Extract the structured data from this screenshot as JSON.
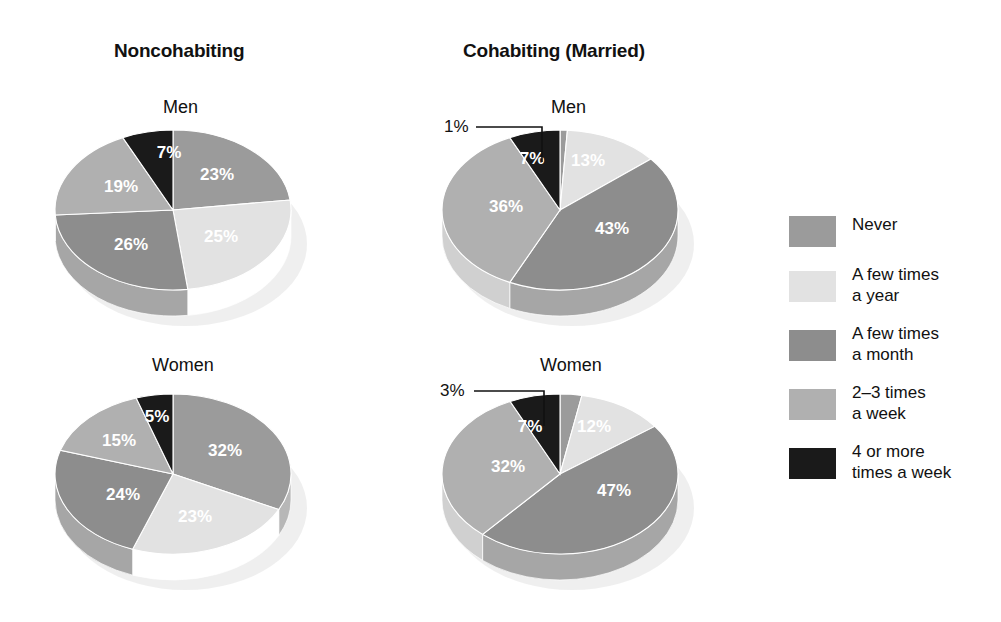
{
  "figure": {
    "columns": [
      {
        "title": "Noncohabiting"
      },
      {
        "title": "Cohabiting (Married)"
      }
    ]
  },
  "legend": {
    "items": [
      {
        "label": "Never",
        "color": "#9b9b9b"
      },
      {
        "label": "A few times\na year",
        "color": "#e2e2e2"
      },
      {
        "label": "A few times\na month",
        "color": "#8d8d8d"
      },
      {
        "label": "2–3 times\na week",
        "color": "#b0b0b0"
      },
      {
        "label": "4 or more\ntimes a week",
        "color": "#1a1a1a"
      }
    ]
  },
  "panels": [
    {
      "id": "noncohabiting-men",
      "group": "Noncohabiting",
      "title": "Men"
    },
    {
      "id": "cohabiting-men",
      "group": "Cohabiting (Married)",
      "title": "Men"
    },
    {
      "id": "noncohabiting-women",
      "group": "Noncohabiting",
      "title": "Women"
    },
    {
      "id": "cohabiting-women",
      "group": "Cohabiting (Married)",
      "title": "Women"
    }
  ],
  "chart_data": [
    {
      "type": "pie",
      "id": "noncohabiting-men",
      "title": "Men",
      "group": "Noncohabiting",
      "categories": [
        "Never",
        "A few times a year",
        "A few times a month",
        "2–3 times a week",
        "4 or more times a week"
      ],
      "values": [
        23,
        25,
        26,
        19,
        7
      ],
      "labels": [
        "23%",
        "25%",
        "26%",
        "19%",
        "7%"
      ],
      "colors": [
        "#9b9b9b",
        "#e2e2e2",
        "#8d8d8d",
        "#b0b0b0",
        "#1a1a1a"
      ],
      "callouts": []
    },
    {
      "type": "pie",
      "id": "cohabiting-men",
      "title": "Men",
      "group": "Cohabiting (Married)",
      "categories": [
        "Never",
        "A few times a year",
        "A few times a month",
        "2–3 times a week",
        "4 or more times a week"
      ],
      "values": [
        1,
        13,
        43,
        36,
        7
      ],
      "labels": [
        "1%",
        "13%",
        "43%",
        "36%",
        "7%"
      ],
      "colors": [
        "#9b9b9b",
        "#e2e2e2",
        "#8d8d8d",
        "#b0b0b0",
        "#1a1a1a"
      ],
      "callouts": [
        "1%"
      ]
    },
    {
      "type": "pie",
      "id": "noncohabiting-women",
      "title": "Women",
      "group": "Noncohabiting",
      "categories": [
        "Never",
        "A few times a year",
        "A few times a month",
        "2–3 times a week",
        "4 or more times a week"
      ],
      "values": [
        32,
        23,
        24,
        15,
        5
      ],
      "labels": [
        "32%",
        "23%",
        "24%",
        "15%",
        "5%"
      ],
      "colors": [
        "#9b9b9b",
        "#e2e2e2",
        "#8d8d8d",
        "#b0b0b0",
        "#1a1a1a"
      ],
      "callouts": []
    },
    {
      "type": "pie",
      "id": "cohabiting-women",
      "title": "Women",
      "group": "Cohabiting (Married)",
      "categories": [
        "Never",
        "A few times a year",
        "A few times a month",
        "2–3 times a week",
        "4 or more times a week"
      ],
      "values": [
        3,
        12,
        47,
        32,
        7
      ],
      "labels": [
        "3%",
        "12%",
        "47%",
        "32%",
        "7%"
      ],
      "colors": [
        "#9b9b9b",
        "#e2e2e2",
        "#8d8d8d",
        "#b0b0b0",
        "#1a1a1a"
      ],
      "callouts": [
        "3%"
      ]
    }
  ],
  "slice_label_positions": {
    "noncohabiting-men": [
      [
        44,
        -34
      ],
      [
        48,
        28
      ],
      [
        -42,
        36
      ],
      [
        -52,
        -22
      ],
      [
        -4,
        -56
      ]
    ],
    "cohabiting-men": [
      [
        0,
        0
      ],
      [
        28,
        -48
      ],
      [
        52,
        20
      ],
      [
        -54,
        -2
      ],
      [
        -28,
        -50
      ]
    ],
    "noncohabiting-women": [
      [
        52,
        -22
      ],
      [
        22,
        44
      ],
      [
        -50,
        22
      ],
      [
        -54,
        -32
      ],
      [
        -16,
        -56
      ]
    ],
    "cohabiting-women": [
      [
        0,
        0
      ],
      [
        34,
        -46
      ],
      [
        54,
        18
      ],
      [
        -52,
        -6
      ],
      [
        -30,
        -46
      ]
    ]
  },
  "callout_geometry": {
    "cohabiting-men": {
      "text_x": 12,
      "text_y": 14,
      "line": "44,9 110,9 110,44"
    },
    "cohabiting-women": {
      "text_x": 8,
      "text_y": 14,
      "line": "42,9 112,9 112,44"
    }
  }
}
